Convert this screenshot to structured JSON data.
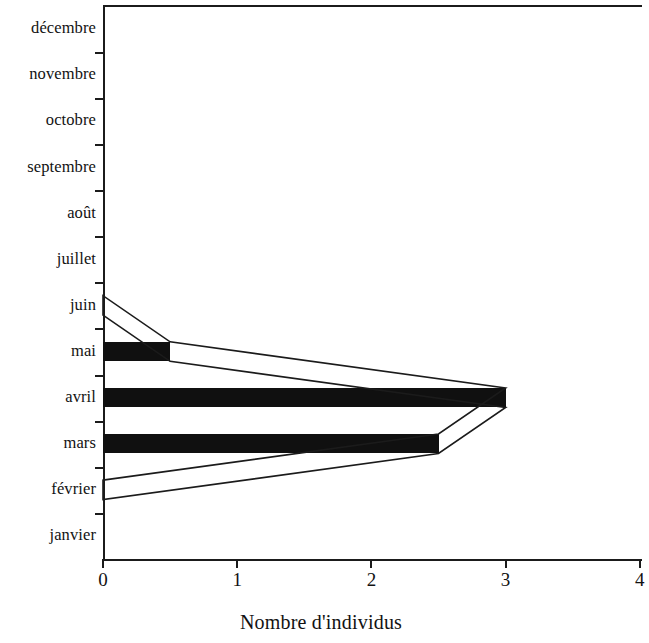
{
  "chart_data": {
    "type": "bar",
    "orientation": "horizontal",
    "title": "",
    "xlabel": "Nombre d'individus",
    "ylabel": "",
    "categories": [
      "janvier",
      "février",
      "mars",
      "avril",
      "mai",
      "juin",
      "juillet",
      "août",
      "septembre",
      "octobre",
      "novembre",
      "décembre"
    ],
    "values": [
      0,
      0,
      2.5,
      3,
      0.5,
      0,
      0,
      0,
      0,
      0,
      0,
      0
    ],
    "series": [
      {
        "name": "Nombre d'individus",
        "values": [
          0,
          0,
          2.5,
          3,
          0.5,
          0,
          0,
          0,
          0,
          0,
          0,
          0
        ]
      }
    ],
    "xlim": [
      0,
      4
    ],
    "xticks": [
      0,
      1,
      2,
      3,
      4
    ],
    "xtick_labels": [
      "0",
      "1",
      "2",
      "3",
      "4"
    ],
    "grid": false,
    "legend": false,
    "category_order": "bottom_to_top",
    "overlay": {
      "type": "kite-outline",
      "description": "polygon outline joining bar tips across adjacent months",
      "points": [
        {
          "category": "février",
          "value": 0
        },
        {
          "category": "mars",
          "value": 2.5
        },
        {
          "category": "avril",
          "value": 3
        },
        {
          "category": "mai",
          "value": 0.5
        },
        {
          "category": "juin",
          "value": 0
        }
      ]
    },
    "colors": {
      "bar_fill": "#101010",
      "axis": "#1b1b1b",
      "background": "#ffffff",
      "outline": "#1b1b1b"
    }
  },
  "axis": {
    "x_title": "Nombre d'individus",
    "x_tick_labels": [
      "0",
      "1",
      "2",
      "3",
      "4"
    ],
    "y_tick_labels": [
      "janvier",
      "février",
      "mars",
      "avril",
      "mai",
      "juin",
      "juillet",
      "août",
      "septembre",
      "octobre",
      "novembre",
      "décembre"
    ]
  }
}
